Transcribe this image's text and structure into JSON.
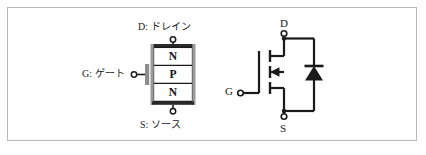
{
  "figure": {
    "background_color": "#ffffff",
    "frame_color": "#b9b9b9",
    "line_color": "#1a1a1a",
    "region_fill_color": "#ffffff",
    "plate_color": "#8a8a8a"
  },
  "structure": {
    "name": "mosfet-cross-section",
    "drain_label": "D: ドレイン",
    "gate_label": "G: ゲート",
    "source_label": "S: ソース",
    "regions": [
      {
        "letter": "N"
      },
      {
        "letter": "P"
      },
      {
        "letter": "N"
      }
    ]
  },
  "symbol": {
    "name": "mosfet-circuit-symbol",
    "drain_label": "D",
    "gate_label": "G",
    "source_label": "S",
    "has_body_diode": true,
    "channel_type": "n-channel"
  }
}
